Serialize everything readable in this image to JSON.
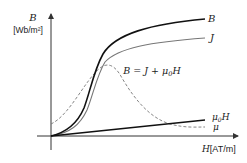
{
  "diagram": {
    "y_axis": {
      "symbol": "B",
      "unit": "[Wb/m²]"
    },
    "x_axis": {
      "symbol": "H",
      "unit": "[AT/m]"
    },
    "equation": {
      "lhs": "B",
      "eq": " = ",
      "j": "J",
      "plus": " + ",
      "mu": "μ",
      "sub": "0",
      "h": "H"
    },
    "curves": [
      {
        "name": "B",
        "label": "B",
        "style": "solid",
        "color": "#111111"
      },
      {
        "name": "J",
        "label": "J",
        "style": "solid",
        "color": "#777777"
      },
      {
        "name": "mu0H",
        "label_mu": "μ",
        "label_sub": "0",
        "label_h": "H",
        "style": "solid",
        "color": "#111111"
      },
      {
        "name": "mu",
        "label": "μ",
        "style": "dashed",
        "color": "#777777"
      }
    ]
  },
  "colors": {
    "axis": "#333333",
    "text": "#222222",
    "primary_curve": "#111111",
    "secondary_curve": "#777777"
  }
}
